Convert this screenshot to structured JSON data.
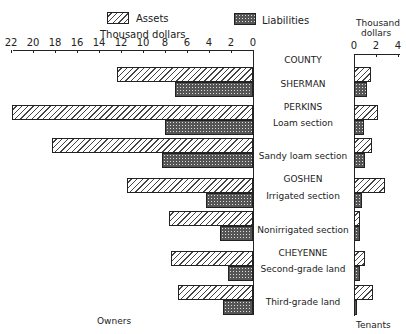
{
  "legend": {
    "assets_label": "Assets",
    "liabilities_label": "Liabilities"
  },
  "owners_axis": {
    "unit_label": "Thousand dollars",
    "ticks": [
      "22",
      "20",
      "18",
      "16",
      "14",
      "12",
      "10",
      "8",
      "6",
      "4",
      "2",
      "0"
    ]
  },
  "tenants_axis": {
    "unit_label_line1": "Thousand",
    "unit_label_line2": "dollars",
    "ticks": [
      "0",
      "2",
      "4"
    ]
  },
  "labels": {
    "county_header": "COUNTY",
    "sherman": "SHERMAN",
    "perkins": "PERKINS",
    "loam": "Loam section",
    "sandy_loam": "Sandy loam section",
    "goshen": "GOSHEN",
    "irrigated": "Irrigated section",
    "nonirrigated": "Nonirrigated section",
    "cheyenne": "CHEYENNE",
    "second_grade": "Second-grade land",
    "third_grade": "Third-grade land",
    "owners": "Owners",
    "tenants": "Tenants"
  },
  "colors": {
    "ink": "#222222",
    "background": "#ffffff"
  },
  "chart_data": [
    {
      "type": "bar",
      "orientation": "horizontal",
      "title": "Owners",
      "xlabel": "Thousand dollars",
      "xlim": [
        22,
        0
      ],
      "x_reversed": true,
      "categories": [
        "Sherman",
        "Perkins – Loam section",
        "Perkins – Sandy loam section",
        "Goshen – Irrigated section",
        "Goshen – Nonirrigated section",
        "Cheyenne – Second-grade land",
        "Cheyenne – Third-grade land"
      ],
      "series": [
        {
          "name": "Assets",
          "values": [
            12.4,
            21.9,
            18.3,
            11.5,
            7.6,
            7.5,
            6.8
          ]
        },
        {
          "name": "Liabilities",
          "values": [
            7.1,
            8.0,
            8.3,
            4.3,
            3.0,
            2.3,
            2.7
          ]
        }
      ],
      "tick_labels": [
        "22",
        "20",
        "18",
        "16",
        "14",
        "12",
        "10",
        "8",
        "6",
        "4",
        "2",
        "0"
      ],
      "legend": [
        "Assets",
        "Liabilities"
      ],
      "legend_position": "top"
    },
    {
      "type": "bar",
      "orientation": "horizontal",
      "title": "Tenants",
      "xlabel": "Thousand dollars",
      "xlim": [
        0,
        4
      ],
      "categories": [
        "Sherman",
        "Perkins – Loam section",
        "Perkins – Sandy loam section",
        "Goshen – Irrigated section",
        "Goshen – Nonirrigated section",
        "Cheyenne – Second-grade land",
        "Cheyenne – Third-grade land"
      ],
      "series": [
        {
          "name": "Assets",
          "values": [
            1.5,
            2.2,
            1.6,
            2.8,
            0.5,
            1.0,
            1.7
          ]
        },
        {
          "name": "Liabilities",
          "values": [
            1.2,
            0.9,
            1.0,
            0.7,
            0.5,
            0.5,
            0.3
          ]
        }
      ],
      "tick_labels": [
        "0",
        "2",
        "4"
      ]
    }
  ]
}
